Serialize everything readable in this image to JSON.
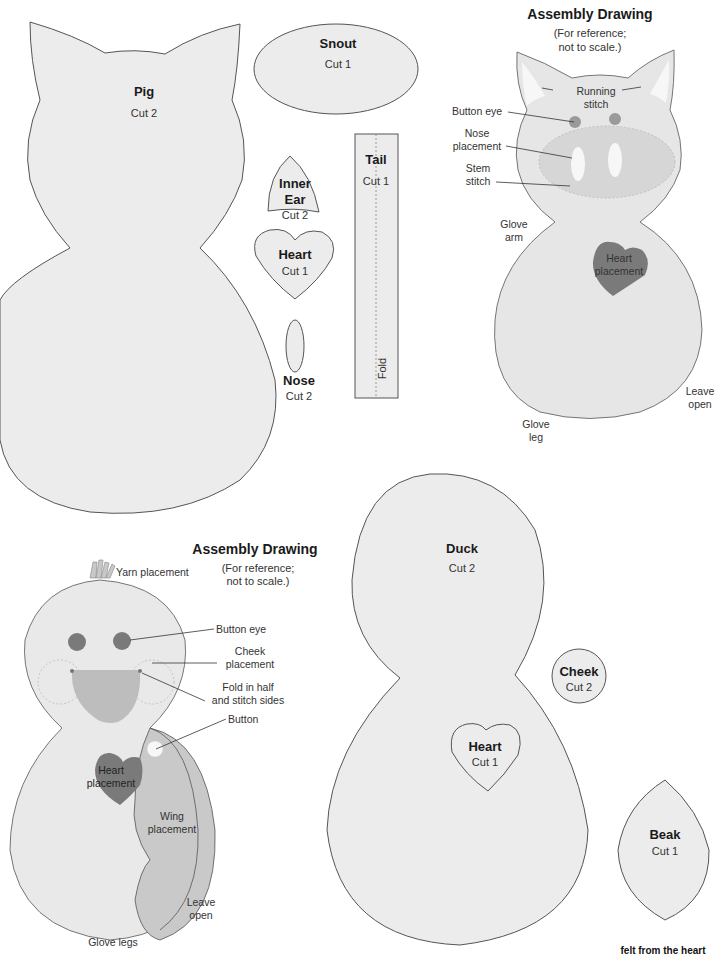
{
  "colors": {
    "felt_fill": "#ececec",
    "outline": "#555555",
    "dark_accent": "#7a7a7a",
    "mid_accent": "#bdbdbd",
    "light_accent": "#f7f7f7"
  },
  "pieces": {
    "pig": {
      "title": "Pig",
      "cut": "Cut 2"
    },
    "snout": {
      "title": "Snout",
      "cut": "Cut 1"
    },
    "inner_ear": {
      "title_line1": "Inner",
      "title_line2": "Ear",
      "cut": "Cut 2"
    },
    "pig_heart": {
      "title": "Heart",
      "cut": "Cut 1"
    },
    "nose": {
      "title": "Nose",
      "cut": "Cut 2"
    },
    "tail": {
      "title": "Tail",
      "cut": "Cut 1",
      "fold": "Fold"
    },
    "duck": {
      "title": "Duck",
      "cut": "Cut 2"
    },
    "cheek": {
      "title": "Cheek",
      "cut": "Cut 2"
    },
    "duck_heart": {
      "title": "Heart",
      "cut": "Cut 1"
    },
    "beak": {
      "title": "Beak",
      "cut": "Cut 1"
    }
  },
  "pig_assembly": {
    "heading": "Assembly Drawing",
    "note_line1": "(For reference;",
    "note_line2": "not to scale.)",
    "callouts": {
      "running_stitch_1": "Running",
      "running_stitch_2": "stitch",
      "button_eye": "Button eye",
      "nose_placement_1": "Nose",
      "nose_placement_2": "placement",
      "stem_stitch_1": "Stem",
      "stem_stitch_2": "stitch",
      "glove_arm_1": "Glove",
      "glove_arm_2": "arm",
      "heart_placement_1": "Heart",
      "heart_placement_2": "placement",
      "leave_open_1": "Leave",
      "leave_open_2": "open",
      "glove_leg_1": "Glove",
      "glove_leg_2": "leg"
    }
  },
  "duck_assembly": {
    "heading": "Assembly Drawing",
    "note_line1": "(For reference;",
    "note_line2": "not to scale.)",
    "callouts": {
      "yarn_placement": "Yarn placement",
      "button_eye": "Button eye",
      "cheek_placement_1": "Cheek",
      "cheek_placement_2": "placement",
      "fold_1": "Fold in half",
      "fold_2": "and stitch sides",
      "button": "Button",
      "heart_placement_1": "Heart",
      "heart_placement_2": "placement",
      "wing_placement_1": "Wing",
      "wing_placement_2": "placement",
      "leave_open_1": "Leave",
      "leave_open_2": "open",
      "glove_legs": "Glove legs"
    }
  },
  "footer": {
    "text": "felt from the heart"
  }
}
